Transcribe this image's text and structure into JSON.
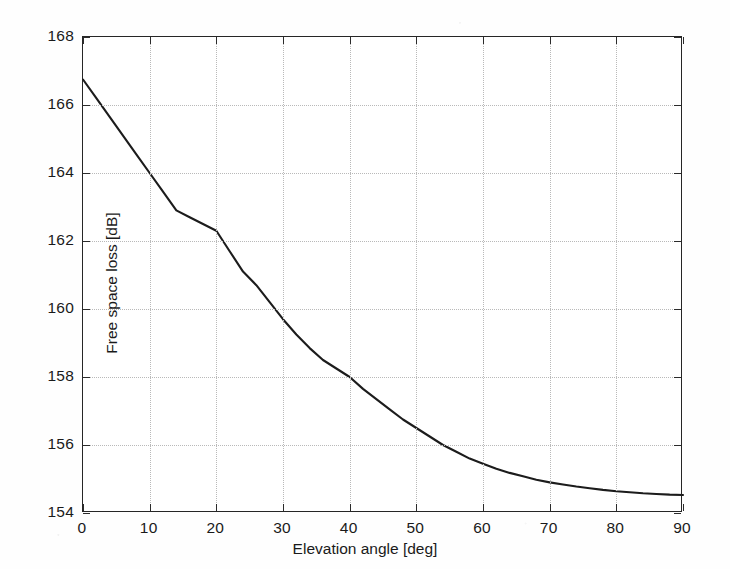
{
  "chart_data": {
    "type": "line",
    "title": "",
    "xlabel": "Elevation angle [deg]",
    "ylabel": "Free space loss [dB]",
    "xlim": [
      0,
      90
    ],
    "ylim": [
      154,
      168
    ],
    "xticks": [
      0,
      10,
      20,
      30,
      40,
      50,
      60,
      70,
      80,
      90
    ],
    "yticks": [
      154,
      156,
      158,
      160,
      162,
      164,
      166,
      168
    ],
    "xtick_labels": [
      "0",
      "10",
      "20",
      "30",
      "40",
      "50",
      "60",
      "70",
      "80",
      "90"
    ],
    "ytick_labels": [
      "154",
      "156",
      "158",
      "160",
      "162",
      "164",
      "166",
      "168"
    ],
    "grid": true,
    "grid_style": "dotted",
    "legend": "none",
    "line_color": "#1c1c1c",
    "grid_color": "#b9b9b9",
    "axis_color": "#262626",
    "background_color": "#ffffff",
    "series": [
      {
        "name": "Free space loss",
        "x": [
          0,
          2,
          4,
          6,
          8,
          10,
          12,
          14,
          16,
          18,
          20,
          22,
          24,
          26,
          28,
          30,
          32,
          34,
          36,
          38,
          40,
          42,
          44,
          46,
          48,
          50,
          52,
          54,
          56,
          58,
          60,
          62,
          64,
          66,
          68,
          70,
          72,
          74,
          76,
          78,
          80,
          82,
          84,
          86,
          88,
          90
        ],
        "y": [
          166.75,
          166.2,
          165.65,
          165.1,
          164.55,
          164.0,
          163.45,
          162.9,
          162.7,
          162.5,
          162.3,
          161.7,
          161.1,
          160.7,
          160.2,
          159.7,
          159.25,
          158.85,
          158.5,
          158.25,
          158.0,
          157.65,
          157.35,
          157.05,
          156.75,
          156.5,
          156.25,
          156.0,
          155.8,
          155.6,
          155.45,
          155.3,
          155.18,
          155.08,
          154.98,
          154.9,
          154.84,
          154.78,
          154.73,
          154.68,
          154.64,
          154.61,
          154.58,
          154.56,
          154.54,
          154.53
        ]
      }
    ],
    "annotations": []
  }
}
